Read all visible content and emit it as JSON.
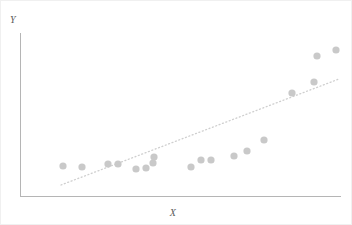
{
  "figure": {
    "width": 352,
    "height": 225,
    "background_color": "#ffffff",
    "border_color": "#f0f0f0"
  },
  "axes": {
    "x_axis_label": "X",
    "y_axis_label": "Y",
    "axis_color": "#b5b5b5",
    "x_axis_y_px": 195,
    "y_axis_x_px": 19,
    "y_axis_top_px": 32,
    "x_axis_right_px": 340
  },
  "style": {
    "marker_color": "#c9c9c9",
    "marker_radius_px": 3.6,
    "trend_color": "#cfcfcf",
    "trend_dash": "1,2.6"
  },
  "trendline": {
    "label": "linear-trend-line",
    "x1_px": 60,
    "y1_px": 184,
    "x2_px": 338,
    "y2_px": 78
  },
  "chart_data": {
    "type": "scatter",
    "title": "",
    "xlabel": "X",
    "ylabel": "Y",
    "grid": false,
    "legend": null,
    "xlim": [
      0,
      1
    ],
    "ylim": [
      0,
      1
    ],
    "annotations": [
      {
        "type": "trendline",
        "fit": "linear",
        "style": "dotted",
        "endpoints_px": [
          [
            60,
            184
          ],
          [
            338,
            78
          ]
        ]
      }
    ],
    "series": [
      {
        "name": "observations",
        "marker": "circle",
        "color": "#c9c9c9",
        "points_px": [
          [
            62,
            165
          ],
          [
            81,
            166
          ],
          [
            107,
            163
          ],
          [
            117,
            163
          ],
          [
            135,
            168
          ],
          [
            145,
            167
          ],
          [
            152,
            162
          ],
          [
            153,
            156
          ],
          [
            190,
            166
          ],
          [
            200,
            159
          ],
          [
            210,
            159
          ],
          [
            233,
            155
          ],
          [
            246,
            150
          ],
          [
            263,
            139
          ],
          [
            291,
            92
          ],
          [
            313,
            81
          ],
          [
            316,
            55
          ],
          [
            335,
            49
          ]
        ],
        "x": [
          0.134,
          0.193,
          0.274,
          0.305,
          0.361,
          0.392,
          0.414,
          0.417,
          0.533,
          0.564,
          0.595,
          0.667,
          0.707,
          0.76,
          0.847,
          0.916,
          0.925,
          0.984
        ],
        "y": [
          0.184,
          0.178,
          0.196,
          0.196,
          0.166,
          0.172,
          0.202,
          0.239,
          0.178,
          0.221,
          0.221,
          0.245,
          0.276,
          0.344,
          0.632,
          0.699,
          0.859,
          0.896
        ]
      }
    ]
  }
}
